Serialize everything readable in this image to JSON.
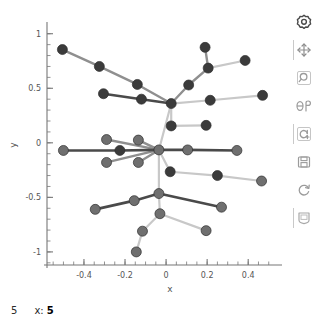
{
  "chart_data": {
    "type": "scatter",
    "title": "",
    "xlabel": "x",
    "ylabel": "y",
    "xlim": [
      -0.58,
      0.55
    ],
    "ylim": [
      -1.12,
      1.08
    ],
    "xticks": [
      -0.4,
      -0.2,
      0,
      0.2,
      0.4
    ],
    "xticklabels": [
      "-0.4",
      "-0.2",
      "0",
      "0.2",
      "0.4"
    ],
    "yticks": [
      1,
      0.5,
      0,
      -0.5,
      -1
    ],
    "yticklabels": [
      "1",
      "0.5",
      "0",
      "-0.5",
      "-1"
    ],
    "grid": false,
    "legend": null,
    "minor_ticks": true,
    "node_radius_px": 5,
    "colors": {
      "node_dark": "#3b3b3b",
      "node_mid": "#6f6f6f",
      "edge_dark": "#4a4a4a",
      "edge_mid": "#8f8f8f",
      "edge_light": "#c8c8c8",
      "axis": "#777777",
      "background": "#ffffff",
      "toolbar_icon": "#9b9b9b",
      "toolbar_icon_active": "#3a3a3a"
    },
    "nodes": [
      {
        "id": 0,
        "x": -0.505,
        "y": 0.855,
        "shade": "dark"
      },
      {
        "id": 1,
        "x": -0.325,
        "y": 0.7,
        "shade": "dark"
      },
      {
        "id": 2,
        "x": -0.14,
        "y": 0.535,
        "shade": "dark"
      },
      {
        "id": 3,
        "x": -0.305,
        "y": 0.45,
        "shade": "dark"
      },
      {
        "id": 4,
        "x": -0.12,
        "y": 0.4,
        "shade": "dark"
      },
      {
        "id": 5,
        "x": 0.025,
        "y": 0.36,
        "shade": "dark"
      },
      {
        "id": 6,
        "x": 0.19,
        "y": 0.875,
        "shade": "dark"
      },
      {
        "id": 7,
        "x": 0.205,
        "y": 0.685,
        "shade": "dark"
      },
      {
        "id": 8,
        "x": 0.385,
        "y": 0.755,
        "shade": "dark"
      },
      {
        "id": 9,
        "x": 0.11,
        "y": 0.53,
        "shade": "dark"
      },
      {
        "id": 10,
        "x": 0.215,
        "y": 0.39,
        "shade": "dark"
      },
      {
        "id": 11,
        "x": 0.47,
        "y": 0.435,
        "shade": "dark"
      },
      {
        "id": 12,
        "x": 0.025,
        "y": 0.155,
        "shade": "dark"
      },
      {
        "id": 13,
        "x": 0.195,
        "y": 0.16,
        "shade": "dark"
      },
      {
        "id": 14,
        "x": -0.29,
        "y": 0.03,
        "shade": "mid"
      },
      {
        "id": 15,
        "x": -0.135,
        "y": 0.025,
        "shade": "mid"
      },
      {
        "id": 16,
        "x": -0.29,
        "y": -0.18,
        "shade": "mid"
      },
      {
        "id": 17,
        "x": -0.135,
        "y": -0.18,
        "shade": "mid"
      },
      {
        "id": 18,
        "x": -0.5,
        "y": -0.07,
        "shade": "mid"
      },
      {
        "id": 19,
        "x": -0.225,
        "y": -0.07,
        "shade": "dark"
      },
      {
        "id": 20,
        "x": -0.035,
        "y": -0.065,
        "shade": "mid"
      },
      {
        "id": 21,
        "x": 0.105,
        "y": -0.065,
        "shade": "mid"
      },
      {
        "id": 22,
        "x": 0.345,
        "y": -0.07,
        "shade": "mid"
      },
      {
        "id": 23,
        "x": 0.02,
        "y": -0.265,
        "shade": "dark"
      },
      {
        "id": 24,
        "x": 0.25,
        "y": -0.3,
        "shade": "dark"
      },
      {
        "id": 25,
        "x": 0.465,
        "y": -0.35,
        "shade": "mid"
      },
      {
        "id": 26,
        "x": -0.035,
        "y": -0.465,
        "shade": "mid"
      },
      {
        "id": 27,
        "x": -0.155,
        "y": -0.53,
        "shade": "mid"
      },
      {
        "id": 28,
        "x": -0.345,
        "y": -0.61,
        "shade": "mid"
      },
      {
        "id": 29,
        "x": 0.27,
        "y": -0.59,
        "shade": "mid"
      },
      {
        "id": 30,
        "x": -0.03,
        "y": -0.65,
        "shade": "mid"
      },
      {
        "id": 31,
        "x": -0.115,
        "y": -0.81,
        "shade": "mid"
      },
      {
        "id": 32,
        "x": 0.195,
        "y": -0.805,
        "shade": "mid"
      },
      {
        "id": 33,
        "x": -0.145,
        "y": -1.0,
        "shade": "mid"
      }
    ],
    "edges": [
      {
        "source": 0,
        "target": 1,
        "shade": "mid"
      },
      {
        "source": 1,
        "target": 2,
        "shade": "mid"
      },
      {
        "source": 2,
        "target": 5,
        "shade": "mid"
      },
      {
        "source": 3,
        "target": 4,
        "shade": "dark"
      },
      {
        "source": 4,
        "target": 5,
        "shade": "dark"
      },
      {
        "source": 6,
        "target": 7,
        "shade": "mid"
      },
      {
        "source": 7,
        "target": 8,
        "shade": "light"
      },
      {
        "source": 7,
        "target": 9,
        "shade": "mid"
      },
      {
        "source": 9,
        "target": 5,
        "shade": "mid"
      },
      {
        "source": 5,
        "target": 10,
        "shade": "light"
      },
      {
        "source": 10,
        "target": 11,
        "shade": "light"
      },
      {
        "source": 5,
        "target": 12,
        "shade": "light"
      },
      {
        "source": 12,
        "target": 13,
        "shade": "light"
      },
      {
        "source": 5,
        "target": 20,
        "shade": "light"
      },
      {
        "source": 14,
        "target": 20,
        "shade": "mid"
      },
      {
        "source": 15,
        "target": 20,
        "shade": "mid"
      },
      {
        "source": 16,
        "target": 20,
        "shade": "mid"
      },
      {
        "source": 17,
        "target": 20,
        "shade": "mid"
      },
      {
        "source": 18,
        "target": 19,
        "shade": "dark"
      },
      {
        "source": 19,
        "target": 20,
        "shade": "dark"
      },
      {
        "source": 20,
        "target": 21,
        "shade": "dark"
      },
      {
        "source": 21,
        "target": 22,
        "shade": "dark"
      },
      {
        "source": 20,
        "target": 23,
        "shade": "light"
      },
      {
        "source": 23,
        "target": 24,
        "shade": "light"
      },
      {
        "source": 24,
        "target": 25,
        "shade": "light"
      },
      {
        "source": 20,
        "target": 26,
        "shade": "light"
      },
      {
        "source": 26,
        "target": 27,
        "shade": "dark"
      },
      {
        "source": 27,
        "target": 28,
        "shade": "dark"
      },
      {
        "source": 26,
        "target": 29,
        "shade": "dark"
      },
      {
        "source": 26,
        "target": 30,
        "shade": "light"
      },
      {
        "source": 30,
        "target": 31,
        "shade": "light"
      },
      {
        "source": 30,
        "target": 32,
        "shade": "light"
      },
      {
        "source": 31,
        "target": 33,
        "shade": "light"
      }
    ]
  },
  "toolbar": {
    "items": [
      {
        "name": "settings-gear-icon",
        "label": "Settings"
      },
      {
        "name": "pan-move-icon",
        "label": "Pan"
      },
      {
        "name": "zoom-search-icon",
        "label": "Zoom"
      },
      {
        "name": "rotate-theta-icon",
        "label": "Rotate"
      },
      {
        "name": "reset-zoom-icon",
        "label": "Reset zoom"
      },
      {
        "name": "save-disk-icon",
        "label": "Save"
      },
      {
        "name": "refresh-icon",
        "label": "Refresh"
      },
      {
        "name": "copy-clipboard-icon",
        "label": "Copy"
      }
    ]
  },
  "statusbar": {
    "index": "5",
    "x_label": "x:",
    "x_value": "5"
  }
}
